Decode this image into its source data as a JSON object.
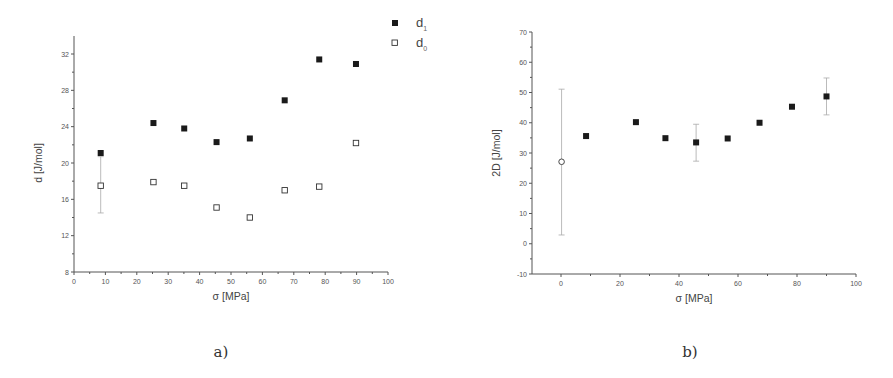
{
  "captions": {
    "a": "a)",
    "b": "b)"
  },
  "chart_data": [
    {
      "id": "a",
      "type": "scatter",
      "title": "",
      "xlabel": "σ [MPa]",
      "ylabel": "d [J/mol]",
      "xlim": [
        0,
        100
      ],
      "ylim": [
        8,
        34
      ],
      "xticks": [
        0,
        10,
        20,
        30,
        40,
        50,
        60,
        70,
        80,
        90,
        100
      ],
      "yticks": [
        8,
        12,
        16,
        20,
        24,
        28,
        32
      ],
      "grid": false,
      "legend_position": "top-right outside",
      "series": [
        {
          "name": "d1",
          "label_main": "d",
          "label_sub": "1",
          "marker": "filled-square",
          "x": [
            8.5,
            25.3,
            35.1,
            45.4,
            56.0,
            67.1,
            78.1,
            89.8
          ],
          "y": [
            21.1,
            24.4,
            23.8,
            22.3,
            22.7,
            26.9,
            31.4,
            30.9
          ]
        },
        {
          "name": "d0",
          "label_main": "d",
          "label_sub": "0",
          "marker": "open-square",
          "x": [
            8.5,
            25.3,
            35.1,
            45.4,
            56.0,
            67.1,
            78.1,
            89.8
          ],
          "y": [
            17.5,
            17.9,
            17.5,
            15.1,
            14.0,
            17.0,
            17.4,
            22.2
          ],
          "error_bars": [
            {
              "x": 8.5,
              "low": 14.5,
              "high": 20.7
            }
          ]
        }
      ]
    },
    {
      "id": "b",
      "type": "scatter",
      "title": "",
      "xlabel": "σ [MPa]",
      "ylabel": "2D [J/mol]",
      "xlim": [
        -10,
        100
      ],
      "ylim": [
        -10,
        70
      ],
      "xticks": [
        0,
        20,
        40,
        60,
        80,
        100
      ],
      "yticks": [
        -10,
        0,
        10,
        20,
        30,
        40,
        50,
        60,
        70
      ],
      "grid": false,
      "series": [
        {
          "name": "2D (open)",
          "marker": "open-circle",
          "x": [
            0.2
          ],
          "y": [
            27.1
          ],
          "error_bars": [
            {
              "x": 0.2,
              "low": 2.9,
              "high": 51.1
            }
          ]
        },
        {
          "name": "2D",
          "marker": "filled-square",
          "x": [
            8.5,
            25.4,
            35.4,
            45.8,
            56.5,
            67.3,
            78.3,
            90.0
          ],
          "y": [
            35.6,
            40.2,
            34.9,
            33.5,
            34.8,
            40.0,
            45.3,
            48.7
          ],
          "error_bars": [
            {
              "x": 45.8,
              "low": 27.3,
              "high": 39.5
            },
            {
              "x": 90.0,
              "low": 42.6,
              "high": 54.8
            }
          ]
        }
      ]
    }
  ]
}
